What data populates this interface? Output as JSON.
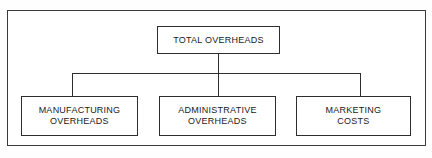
{
  "diagram": {
    "type": "organizational-hierarchy",
    "colors": {
      "background": "#ffffff",
      "line": "#2e2e2e",
      "frame": "#3a3a3a",
      "text": "#1a1a1a"
    },
    "root": {
      "id": "total-overheads",
      "label": "TOTAL OVERHEADS"
    },
    "children": [
      {
        "id": "manufacturing-overheads",
        "label": "MANUFACTURING\nOVERHEADS"
      },
      {
        "id": "administrative-overheads",
        "label": "ADMINISTRATIVE\nOVERHEADS"
      },
      {
        "id": "marketing-costs",
        "label": "MARKETING\nCOSTS"
      }
    ],
    "connectors": [
      {
        "id": "stem-root",
        "from": "total-overheads",
        "to": "bus"
      },
      {
        "id": "bus",
        "from": "bus",
        "to": "bus"
      },
      {
        "id": "drop-left",
        "from": "bus",
        "to": "manufacturing-overheads"
      },
      {
        "id": "drop-middle",
        "from": "bus",
        "to": "administrative-overheads"
      },
      {
        "id": "drop-right",
        "from": "bus",
        "to": "marketing-costs"
      }
    ]
  }
}
